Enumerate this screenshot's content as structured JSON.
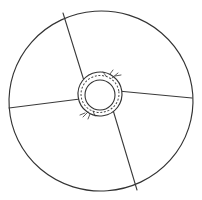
{
  "figure": {
    "title": "Wheel with four spokes and annotated hub",
    "background_color": "#ffffff",
    "line_color": "#333333",
    "canvas": {
      "width": 202,
      "height": 200
    }
  },
  "shapes": {
    "outer_rim": {
      "name": "outer-rim-circle",
      "cx": 101,
      "cy": 101,
      "rx": 92,
      "ry": 90,
      "rotation": -4
    },
    "hub_outer": {
      "name": "hub-outer-circle",
      "cx": 100,
      "cy": 94,
      "rx": 22,
      "ry": 22,
      "rotation": -8
    },
    "hub_dashed": {
      "name": "hub-dashed-ring",
      "cx": 100,
      "cy": 94,
      "rx": 19,
      "ry": 18.5,
      "rotation": -8
    },
    "hub_inner": {
      "name": "hub-inner-circle",
      "cx": 100,
      "cy": 95,
      "rx": 15,
      "ry": 15,
      "rotation": 0
    }
  },
  "spokes": [
    {
      "label": "spoke-upper-left",
      "x1": 85,
      "y1": 84,
      "x2": 63,
      "y2": 13
    },
    {
      "label": "spoke-left",
      "x1": 80,
      "y1": 99,
      "x2": 9,
      "y2": 108
    },
    {
      "label": "spoke-right",
      "x1": 118,
      "y1": 91,
      "x2": 192,
      "y2": 98
    },
    {
      "label": "spoke-lower-right",
      "x1": 113,
      "y1": 110,
      "x2": 137,
      "y2": 190
    }
  ],
  "tick_marks": [
    {
      "label": "tick-upper-right-a",
      "x1": 112,
      "y1": 78,
      "x2": 118,
      "y2": 73
    },
    {
      "label": "tick-upper-right-b",
      "x1": 115,
      "y1": 76,
      "x2": 121,
      "y2": 75
    },
    {
      "label": "tick-upper-right-c",
      "x1": 110,
      "y1": 74,
      "x2": 113,
      "y2": 70
    },
    {
      "label": "tick-upper-right-d",
      "x1": 106,
      "y1": 76,
      "x2": 103,
      "y2": 72
    },
    {
      "label": "tick-lower-left-a",
      "x1": 88,
      "y1": 112,
      "x2": 83,
      "y2": 117
    },
    {
      "label": "tick-lower-left-b",
      "x1": 85,
      "y1": 113,
      "x2": 80,
      "y2": 115
    },
    {
      "label": "tick-lower-left-c",
      "x1": 90,
      "y1": 114,
      "x2": 88,
      "y2": 119
    },
    {
      "label": "tick-lower-left-d",
      "x1": 93,
      "y1": 111,
      "x2": 95,
      "y2": 116
    }
  ]
}
